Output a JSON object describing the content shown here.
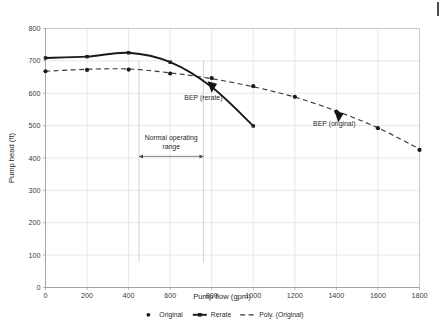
{
  "chart_data": {
    "type": "line",
    "title": "",
    "xlabel": "Pump flow (gpm)",
    "ylabel": "Pump head (ft)",
    "xlim": [
      0,
      1800
    ],
    "ylim": [
      0,
      800
    ],
    "xticks": [
      0,
      200,
      400,
      600,
      800,
      1000,
      1200,
      1400,
      1600,
      1800
    ],
    "yticks": [
      0,
      100,
      200,
      300,
      400,
      500,
      600,
      700,
      800
    ],
    "grid": true,
    "legend_position": "bottom",
    "series": [
      {
        "name": "Original",
        "style": "markers",
        "x": [
          0,
          200,
          400,
          600,
          800,
          1000,
          1200,
          1400,
          1600,
          1800
        ],
        "y": [
          668,
          672,
          673,
          661,
          647,
          622,
          589,
          543,
          492,
          425
        ]
      },
      {
        "name": "Rerate",
        "style": "solid-line-with-markers",
        "x": [
          0,
          200,
          400,
          600,
          800,
          1000
        ],
        "y": [
          709,
          713,
          725,
          696,
          619,
          499
        ]
      },
      {
        "name": "Poly. (Original)",
        "style": "dashed-trendline",
        "x": [
          0,
          200,
          400,
          600,
          800,
          1000,
          1200,
          1400,
          1600,
          1800
        ],
        "y": [
          668,
          674,
          675,
          663,
          645,
          620,
          588,
          545,
          493,
          428
        ]
      }
    ],
    "annotations": [
      {
        "id": "bep-rerate",
        "text": "BEP (rerate)",
        "marker": "triangle-left",
        "point_x": 780,
        "point_y": 637,
        "label_x": 760,
        "label_y": 578
      },
      {
        "id": "bep-original",
        "text": "BEP (original)",
        "marker": "triangle-left",
        "point_x": 1390,
        "point_y": 546,
        "label_x": 1390,
        "label_y": 498
      },
      {
        "id": "normal-operating-range",
        "text_line1": "Normal operating",
        "text_line2": "range",
        "range_start_x": 450,
        "range_end_x": 760,
        "bar_y": 405,
        "label_y": 455
      }
    ]
  },
  "legend": {
    "items": [
      {
        "label": "Original",
        "marker": "dot"
      },
      {
        "label": "Rerate",
        "marker": "line-dot"
      },
      {
        "label": "Poly. (Original)",
        "marker": "dashed"
      }
    ]
  },
  "axes": {
    "x_title": "Pump flow (gpm)",
    "y_title": "Pump head (ft)",
    "x_tick_labels": [
      "0",
      "200",
      "400",
      "600",
      "800",
      "1000",
      "1200",
      "1400",
      "1600",
      "1800"
    ],
    "y_tick_labels": [
      "0",
      "100",
      "200",
      "300",
      "400",
      "500",
      "600",
      "700",
      "800"
    ]
  },
  "colors": {
    "line": "#1a1a1a",
    "grid": "#d9d9d9",
    "text": "#2b2b2b"
  }
}
